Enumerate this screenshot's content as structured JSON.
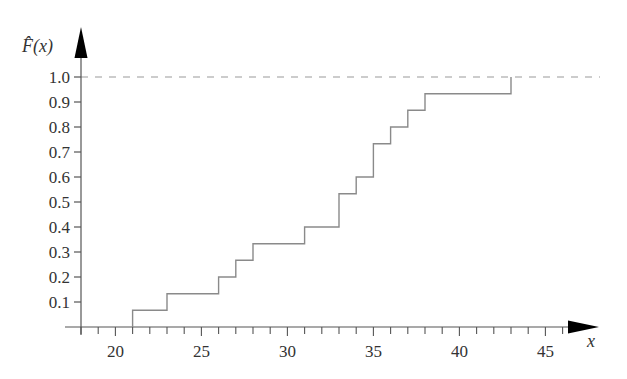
{
  "chart_data": {
    "type": "line",
    "subtype": "empirical-cdf-step",
    "title": "",
    "xlabel": "x",
    "ylabel": "F̂(x)",
    "xlim": [
      18,
      46
    ],
    "ylim": [
      0,
      1.0
    ],
    "x_ticks_major": [
      20,
      25,
      30,
      35,
      40,
      45
    ],
    "x_ticks_minor_step": 1,
    "y_ticks": [
      0.1,
      0.2,
      0.3,
      0.4,
      0.5,
      0.6,
      0.7,
      0.8,
      0.9,
      1.0
    ],
    "y_tick_labels": [
      "0.1",
      "0.2",
      "0.3",
      "0.4",
      "0.5",
      "0.6",
      "0.7",
      "0.8",
      "0.9",
      "1.0"
    ],
    "x_tick_labels": [
      "20",
      "25",
      "30",
      "35",
      "40",
      "45"
    ],
    "reference_line": {
      "y": 1.0,
      "style": "dashed"
    },
    "grid": false,
    "legend": null,
    "sample_size": 15,
    "steps": [
      {
        "x": 21,
        "y": 0.067
      },
      {
        "x": 23,
        "y": 0.133
      },
      {
        "x": 26,
        "y": 0.2
      },
      {
        "x": 27,
        "y": 0.267
      },
      {
        "x": 28,
        "y": 0.333
      },
      {
        "x": 31,
        "y": 0.4
      },
      {
        "x": 33,
        "y": 0.533
      },
      {
        "x": 34,
        "y": 0.6
      },
      {
        "x": 35,
        "y": 0.733
      },
      {
        "x": 36,
        "y": 0.8
      },
      {
        "x": 37,
        "y": 0.867
      },
      {
        "x": 38,
        "y": 0.933
      },
      {
        "x": 43,
        "y": 1.0
      }
    ],
    "colors": {
      "step_line": "#8a8a8a",
      "axis": "#555555",
      "dashed_line": "#999999",
      "arrow": "#000000"
    }
  },
  "labels": {
    "y_axis_title": "F̂(x)",
    "x_axis_title": "x"
  }
}
